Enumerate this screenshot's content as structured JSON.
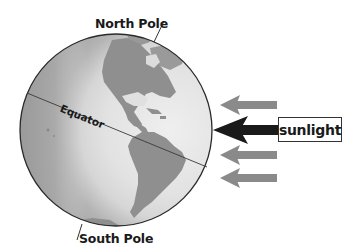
{
  "diagram": {
    "type": "earth-sunlight-illustration",
    "labels": {
      "north_pole": "North Pole",
      "south_pole": "South Pole",
      "equator": "Equator",
      "sunlight": "sunlight"
    },
    "globe": {
      "center_x": 116,
      "center_y": 130,
      "radius": 96,
      "lit_side": "right",
      "shadow_side": "left"
    },
    "arrows": [
      {
        "name": "sun-ray-1",
        "y": 105,
        "color": "#8a8a8a",
        "direction": "left"
      },
      {
        "name": "sun-ray-main",
        "y": 130,
        "color": "#1a1a1a",
        "direction": "left"
      },
      {
        "name": "sun-ray-2",
        "y": 155,
        "color": "#8a8a8a",
        "direction": "left"
      },
      {
        "name": "sun-ray-3",
        "y": 178,
        "color": "#8a8a8a",
        "direction": "left"
      }
    ],
    "colors": {
      "ocean_lit": "#e6e6e6",
      "ocean_dark": "#9a9a9a",
      "land": "#8f8f8f",
      "outline": "#2a2a2a"
    }
  }
}
